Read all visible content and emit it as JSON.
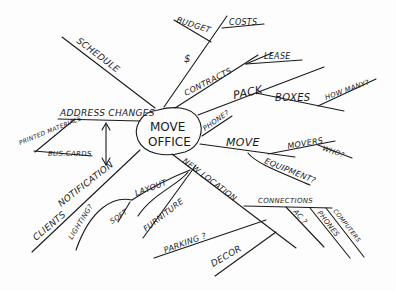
{
  "center": {
    "line1": "MOVE",
    "line2": "OFFICE"
  },
  "branches": {
    "schedule": "SCHEDULE",
    "budget": "BUDGET",
    "budget_symbol": "$",
    "costs": "COSTS",
    "contracts": "CONTRACTS",
    "lease": "LEASE",
    "pack": "PACK",
    "boxes": "BOXES",
    "how_many": "HOW MANY?",
    "phone": "PHONE?",
    "move": "MOVE",
    "movers": "MOVERS",
    "who": "WHO?",
    "equipment": "EQUIPMENT?",
    "new_location": "NEW LOCATION",
    "connections": "CONNECTIONS",
    "ac": "AC ?",
    "phones": "PHONES",
    "computers": "COMPUTERS",
    "layout": "LAYOUT",
    "soft": "SOFT",
    "furniture": "FURNITURE",
    "parking": "PARKING ?",
    "decor": "DECOR",
    "lighting": "LIGHTING?",
    "address_changes": "ADDRESS CHANGES",
    "printed_materials": "PRINTED MATERIALS",
    "bus_cards": "BUS.CARDS",
    "notification": "NOTIFICATION",
    "clients": "CLIENTS"
  }
}
